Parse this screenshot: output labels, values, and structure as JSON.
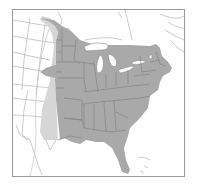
{
  "map": {
    "type": "range-map",
    "region": "Eastern North America",
    "colors": {
      "background": "#ffffff",
      "frame": "#9a9a9a",
      "border_lines": "#a8a8a8",
      "primary_range": "#a9a9a9",
      "secondary_range": "#d6d6d6",
      "lakes": "#ffffff",
      "state_lines": "#7f7f7f"
    },
    "legend": [],
    "labels": []
  }
}
